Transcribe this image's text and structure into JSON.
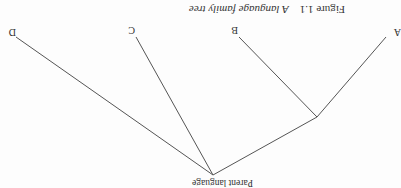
{
  "figure": {
    "number": "Figure 1.1",
    "title": "A language family tree",
    "orientation": "rotated 180°"
  },
  "tree": {
    "root": "Parent language",
    "leaves": [
      "A",
      "B",
      "C",
      "D"
    ],
    "line_color": "#555555"
  }
}
